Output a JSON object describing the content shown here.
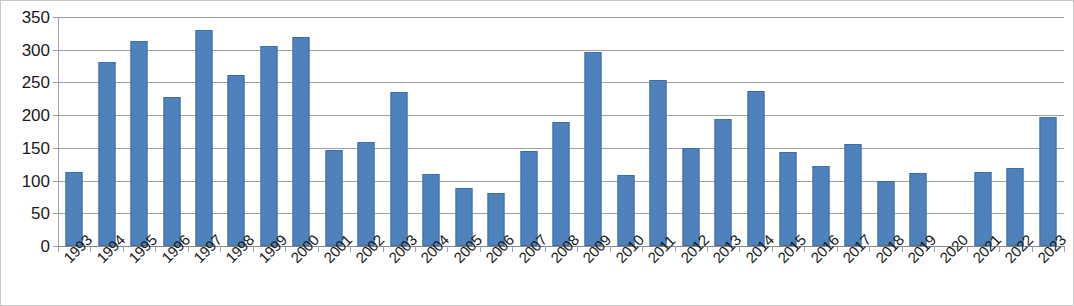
{
  "chart_data": {
    "type": "bar",
    "title": "",
    "subtitle": "",
    "xlabel": "",
    "ylabel": "",
    "ylim": [
      0,
      350
    ],
    "ytick_step": 50,
    "yticks": [
      0,
      50,
      100,
      150,
      200,
      250,
      300,
      350
    ],
    "grid": true,
    "legend": false,
    "legend_position": "none",
    "bar_color": "#4F81BD",
    "categories": [
      "1993",
      "1994",
      "1995",
      "1996",
      "1997",
      "1998",
      "1999",
      "2000",
      "2001",
      "2002",
      "2003",
      "2004",
      "2005",
      "2006",
      "2007",
      "2008",
      "2009",
      "2010",
      "2011",
      "2012",
      "2013",
      "2014",
      "2015",
      "2016",
      "2017",
      "2018",
      "2019",
      "2020",
      "2021",
      "2022",
      "2023"
    ],
    "values": [
      113,
      281,
      313,
      228,
      330,
      261,
      305,
      320,
      146,
      159,
      235,
      110,
      89,
      81,
      145,
      189,
      297,
      109,
      253,
      150,
      194,
      237,
      143,
      123,
      156,
      100,
      111,
      0,
      113,
      119,
      197
    ],
    "series": [
      {
        "name": "Series 1",
        "values": [
          113,
          281,
          313,
          228,
          330,
          261,
          305,
          320,
          146,
          159,
          235,
          110,
          89,
          81,
          145,
          189,
          297,
          109,
          253,
          150,
          194,
          237,
          143,
          123,
          156,
          100,
          111,
          0,
          113,
          119,
          197
        ]
      }
    ]
  }
}
